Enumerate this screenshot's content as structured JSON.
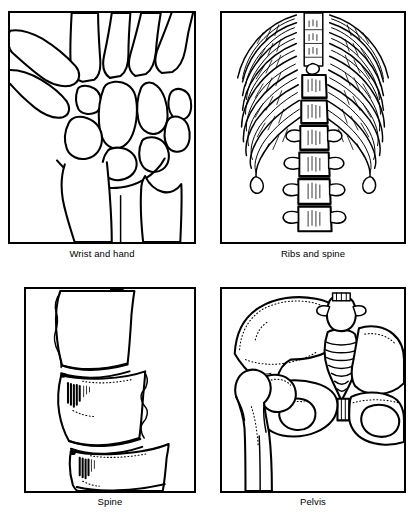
{
  "figure": {
    "kind": "anatomical-line-illustration-grid",
    "layout": "2x2",
    "background_color": "#ffffff",
    "ink_color": "#000000",
    "panel_count": 4
  },
  "panels": [
    {
      "id": "wrist",
      "caption": "Wrist and hand",
      "subject": "wrist-and-hand-bones",
      "position": "top-left",
      "description": "Line drawing of wrist carpal bones with metacarpals above and radius and ulna below"
    },
    {
      "id": "ribs",
      "caption": "Ribs and spine",
      "subject": "ribs-and-thoracic-lumbar-spine",
      "position": "top-right",
      "description": "Line drawing of the lower rib cage with vertebral column descending through the center"
    },
    {
      "id": "spine",
      "caption": "Spine",
      "subject": "lumbar-vertebrae-close-up",
      "position": "bottom-left",
      "description": "Close-up line drawing of three stacked lumbar vertebral bodies with intervertebral discs"
    },
    {
      "id": "pelvis",
      "caption": "Pelvis",
      "subject": "pelvis-and-proximal-femur",
      "position": "bottom-right",
      "description": "Line drawing of the pelvis with sacrum, ilium, acetabulum, pubic symphysis and femoral head and shaft"
    }
  ]
}
